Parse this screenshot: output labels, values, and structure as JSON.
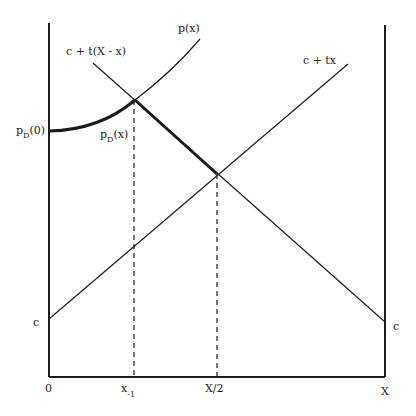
{
  "diagram": {
    "type": "economics-price-diagram",
    "axes": {
      "origin_label": "0",
      "x_ticks": [
        {
          "id": "x_minus_1",
          "label_main": "x",
          "label_sub": "-1"
        },
        {
          "id": "half",
          "label": "X/2"
        },
        {
          "id": "end",
          "label": "X"
        }
      ],
      "left_c_label": "c",
      "right_c_label": "c"
    },
    "curves": {
      "p_x": {
        "label": "p(x)"
      },
      "c_plus_t_X_minus_x": {
        "label": "c + t(X - x)"
      },
      "c_plus_tx": {
        "label": "c + tx"
      }
    },
    "points": {
      "pD0": {
        "label_main": "p",
        "label_sub": "D",
        "label_tail": "(0)"
      },
      "pDx": {
        "label_main": "p",
        "label_sub": "D",
        "label_tail": "(x)"
      }
    },
    "colors": {
      "line": "#1a1a1a",
      "background": "#ffffff"
    }
  }
}
